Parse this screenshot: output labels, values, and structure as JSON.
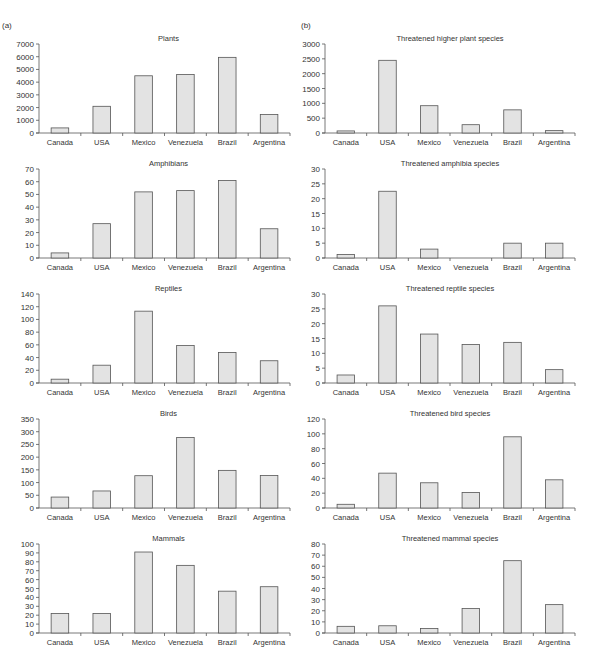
{
  "panels": {
    "a_label": "(a)",
    "b_label": "(b)"
  },
  "chart_data": [
    {
      "type": "bar",
      "panel": "a",
      "title": "Plants",
      "categories": [
        "Canada",
        "USA",
        "Mexico",
        "Venezuela",
        "Brazil",
        "Argentina"
      ],
      "values": [
        400,
        2100,
        4500,
        4600,
        5950,
        1450
      ],
      "yticks": [
        0,
        1000,
        2000,
        3000,
        4000,
        5000,
        6000,
        7000
      ],
      "ylim": [
        0,
        7000
      ],
      "xlabel": "",
      "ylabel": "",
      "grid": false
    },
    {
      "type": "bar",
      "panel": "b",
      "title": "Threatened higher plant species",
      "categories": [
        "Canada",
        "USA",
        "Mexico",
        "Venezuela",
        "Brazil",
        "Argentina"
      ],
      "values": [
        70,
        2450,
        920,
        280,
        780,
        80
      ],
      "yticks": [
        0,
        500,
        1000,
        1500,
        2000,
        2500,
        3000
      ],
      "ylim": [
        0,
        3000
      ],
      "xlabel": "",
      "ylabel": "",
      "grid": false
    },
    {
      "type": "bar",
      "panel": "a",
      "title": "Amphibians",
      "categories": [
        "Canada",
        "USA",
        "Mexico",
        "Venezuela",
        "Brazil",
        "Argentina"
      ],
      "values": [
        4,
        27,
        52,
        53,
        61,
        23
      ],
      "yticks": [
        0,
        10,
        20,
        30,
        40,
        50,
        60,
        70
      ],
      "ylim": [
        0,
        70
      ],
      "xlabel": "",
      "ylabel": "",
      "grid": false
    },
    {
      "type": "bar",
      "panel": "b",
      "title": "Threatened amphibia species",
      "categories": [
        "Canada",
        "USA",
        "Mexico",
        "Venezuela",
        "Brazil",
        "Argentina"
      ],
      "values": [
        1.2,
        22.5,
        3,
        0,
        5,
        5
      ],
      "yticks": [
        0,
        5,
        10,
        15,
        20,
        25,
        30
      ],
      "ylim": [
        0,
        30
      ],
      "xlabel": "",
      "ylabel": "",
      "grid": false
    },
    {
      "type": "bar",
      "panel": "a",
      "title": "Reptiles",
      "categories": [
        "Canada",
        "USA",
        "Mexico",
        "Venezuela",
        "Brazil",
        "Argentina"
      ],
      "values": [
        6,
        28,
        113,
        59,
        48,
        35
      ],
      "yticks": [
        0,
        20,
        40,
        60,
        80,
        100,
        120,
        140
      ],
      "ylim": [
        0,
        140
      ],
      "xlabel": "",
      "ylabel": "",
      "grid": false
    },
    {
      "type": "bar",
      "panel": "b",
      "title": "Threatened reptile species",
      "categories": [
        "Canada",
        "USA",
        "Mexico",
        "Venezuela",
        "Brazil",
        "Argentina"
      ],
      "values": [
        2.7,
        26,
        16.5,
        13,
        13.7,
        4.5
      ],
      "yticks": [
        0,
        5,
        10,
        15,
        20,
        25,
        30
      ],
      "ylim": [
        0,
        30
      ],
      "xlabel": "",
      "ylabel": "",
      "grid": false
    },
    {
      "type": "bar",
      "panel": "a",
      "title": "Birds",
      "categories": [
        "Canada",
        "USA",
        "Mexico",
        "Venezuela",
        "Brazil",
        "Argentina"
      ],
      "values": [
        43,
        67,
        127,
        277,
        148,
        128
      ],
      "yticks": [
        0,
        50,
        100,
        150,
        200,
        250,
        300,
        350
      ],
      "ylim": [
        0,
        350
      ],
      "xlabel": "",
      "ylabel": "",
      "grid": false
    },
    {
      "type": "bar",
      "panel": "b",
      "title": "Threatened bird species",
      "categories": [
        "Canada",
        "USA",
        "Mexico",
        "Venezuela",
        "Brazil",
        "Argentina"
      ],
      "values": [
        5,
        47,
        34,
        21,
        96,
        38
      ],
      "yticks": [
        0,
        20,
        40,
        60,
        80,
        100,
        120
      ],
      "ylim": [
        0,
        120
      ],
      "xlabel": "",
      "ylabel": "",
      "grid": false
    },
    {
      "type": "bar",
      "panel": "a",
      "title": "Mammals",
      "categories": [
        "Canada",
        "USA",
        "Mexico",
        "Venezuela",
        "Brazil",
        "Argentina"
      ],
      "values": [
        22,
        22,
        91,
        76,
        47,
        52
      ],
      "yticks": [
        0,
        10,
        20,
        30,
        40,
        50,
        60,
        70,
        80,
        90,
        100
      ],
      "ylim": [
        0,
        100
      ],
      "xlabel": "",
      "ylabel": "",
      "grid": false
    },
    {
      "type": "bar",
      "panel": "b",
      "title": "Threatened mammal species",
      "categories": [
        "Canada",
        "USA",
        "Mexico",
        "Venezuela",
        "Brazil",
        "Argentina"
      ],
      "values": [
        6,
        6.5,
        4,
        22,
        65,
        25.5
      ],
      "yticks": [
        0,
        10,
        20,
        30,
        40,
        50,
        60,
        70,
        80
      ],
      "ylim": [
        0,
        80
      ],
      "xlabel": "",
      "ylabel": "",
      "grid": false
    }
  ],
  "style": {
    "bar_fill": "#e3e3e3",
    "bar_stroke": "#555555",
    "axis_color": "#555555",
    "background": "#ffffff"
  }
}
